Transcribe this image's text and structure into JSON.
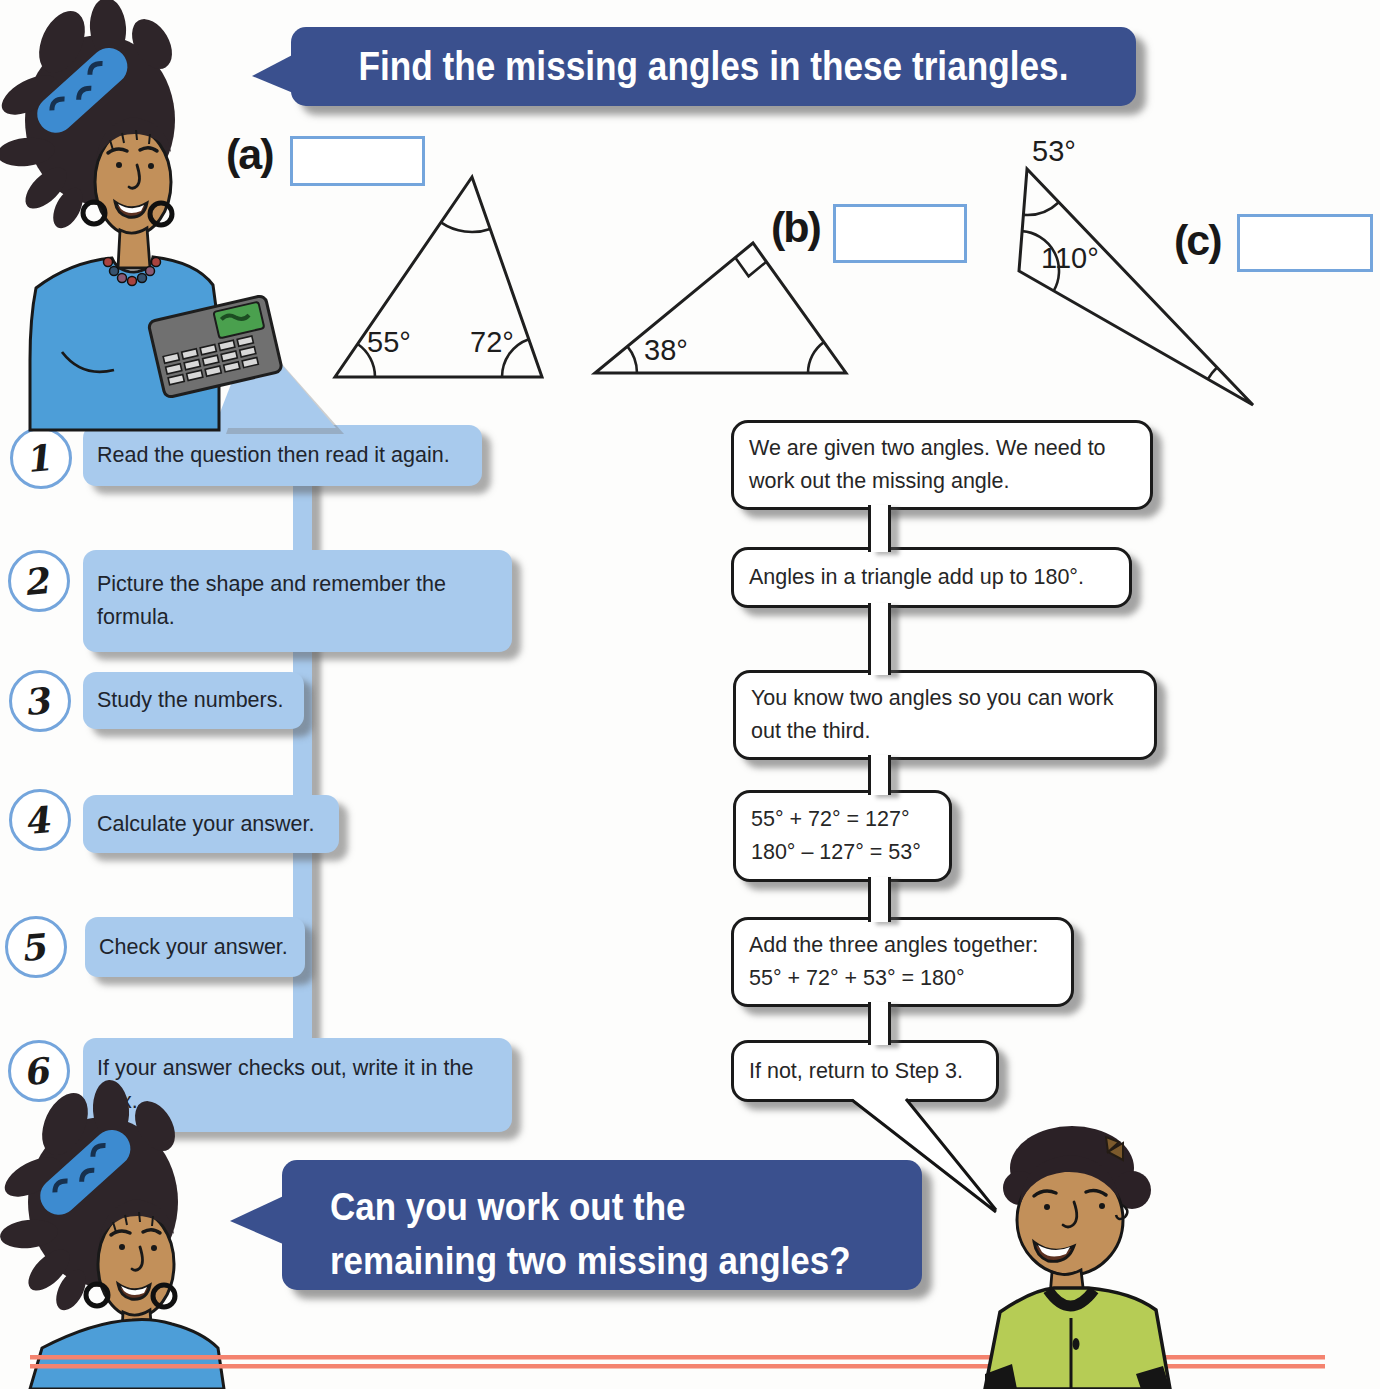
{
  "banners": {
    "top_text": "Find the missing angles in these triangles.",
    "bottom_lines": [
      "Can you work out the",
      "remaining two missing angles?"
    ]
  },
  "problems": [
    {
      "label": "(a)",
      "angles": [
        "55°",
        "72°"
      ]
    },
    {
      "label": "(b)",
      "angles": [
        "38°"
      ],
      "right_angle": true
    },
    {
      "label": "(c)",
      "angles": [
        "53°",
        "110°"
      ]
    }
  ],
  "steps": [
    {
      "num": "1",
      "lines": [
        "Read the question then read it again."
      ]
    },
    {
      "num": "2",
      "lines": [
        "Picture the shape and remember the",
        "formula."
      ]
    },
    {
      "num": "3",
      "lines": [
        "Study the numbers."
      ]
    },
    {
      "num": "4",
      "lines": [
        "Calculate your answer."
      ]
    },
    {
      "num": "5",
      "lines": [
        "Check your answer."
      ]
    },
    {
      "num": "6",
      "lines": [
        "If your answer checks out, write it in the",
        "box."
      ]
    }
  ],
  "answers": [
    {
      "lines": [
        "We are given two angles. We need to",
        "work out the missing angle."
      ]
    },
    {
      "lines": [
        "Angles in a triangle add up to 180°."
      ]
    },
    {
      "lines": [
        "You know two angles so you can work",
        "out the third."
      ]
    },
    {
      "lines": [
        "55° + 72° = 127°",
        "180° – 127° = 53°"
      ]
    },
    {
      "lines": [
        "Add the three angles together:",
        "55° + 72° + 53° = 180°"
      ]
    },
    {
      "lines": [
        "If not, return to Step 3."
      ]
    }
  ],
  "colors": {
    "navy": "#3A508E",
    "panel_blue": "#A8CAED",
    "outline_blue": "#74A5DC",
    "footer_red": "#F4836F",
    "shirt_blue": "#4D9ED8",
    "shirt_green": "#B6CC55"
  }
}
